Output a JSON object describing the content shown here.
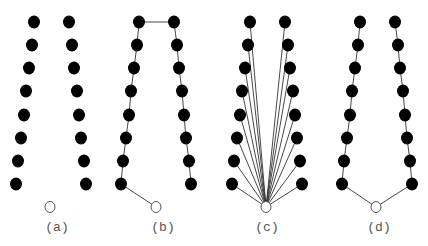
{
  "figure": {
    "colors": {
      "filled_node": "#000000",
      "root_node_fill": "#ffffff",
      "root_node_stroke": "#555555",
      "edge": "#333333",
      "label": "#555555"
    },
    "nodes_per_column": 8,
    "panels": [
      {
        "id": "a",
        "label": "(a)",
        "connection": "none"
      },
      {
        "id": "b",
        "label": "(b)",
        "connection": "path-through-top"
      },
      {
        "id": "c",
        "label": "(c)",
        "connection": "star-from-root"
      },
      {
        "id": "d",
        "label": "(d)",
        "connection": "two-chains-from-root"
      }
    ]
  }
}
